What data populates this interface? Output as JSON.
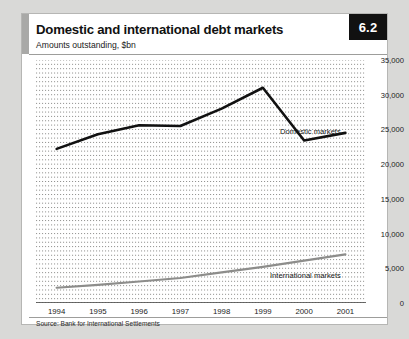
{
  "card": {
    "badge": "6.2",
    "title": "Domestic and international debt markets",
    "subtitle": "Amounts outstanding, $bn",
    "source": "Source: Bank for International Settlements"
  },
  "colors": {
    "badge_bg": "#111111",
    "badge_text": "#ffffff",
    "accent_bar": "#a9a9a7",
    "domestic_line": "#111111",
    "international_line": "#8d8d8b",
    "gridline": "#777775",
    "page_bg": "#d9d9d7",
    "card_bg": "#ffffff"
  },
  "chart_data": {
    "type": "line",
    "title": "Domestic and international debt markets",
    "subtitle": "Amounts outstanding, $bn",
    "xlabel": "",
    "ylabel": "",
    "categories": [
      "1994",
      "1995",
      "1996",
      "1997",
      "1998",
      "1999",
      "2000",
      "2001"
    ],
    "x": [
      1994,
      1995,
      1996,
      1997,
      1998,
      1999,
      2000,
      2001
    ],
    "ylim": [
      0,
      35000
    ],
    "yticks": [
      0,
      5000,
      10000,
      15000,
      20000,
      25000,
      30000,
      35000
    ],
    "ytick_labels": [
      "0",
      "5,000",
      "10,000",
      "15,000",
      "20,000",
      "25,000",
      "30,000",
      "35,000"
    ],
    "y_axis_position": "right",
    "grid": true,
    "grid_style": "dotted-horizontal",
    "legend": "inline-annotations",
    "series": [
      {
        "name": "Domestic markets",
        "label": "Domestic markets",
        "color": "#111111",
        "values": [
          22200,
          24300,
          25600,
          25500,
          28000,
          31000,
          23400,
          24500
        ]
      },
      {
        "name": "International markets",
        "label": "International markets",
        "color": "#8d8d8b",
        "values": [
          2200,
          2600,
          3100,
          3600,
          4400,
          5200,
          6100,
          7000
        ]
      }
    ]
  }
}
